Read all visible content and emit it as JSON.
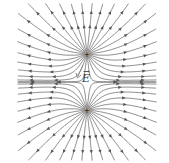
{
  "diagram": {
    "type": "electric-field-lines",
    "charges": [
      {
        "sign": "+",
        "x": 87,
        "y": 54
      },
      {
        "sign": "+",
        "x": 87,
        "y": 110
      }
    ],
    "field_label": "E",
    "line_color": "#555555"
  }
}
